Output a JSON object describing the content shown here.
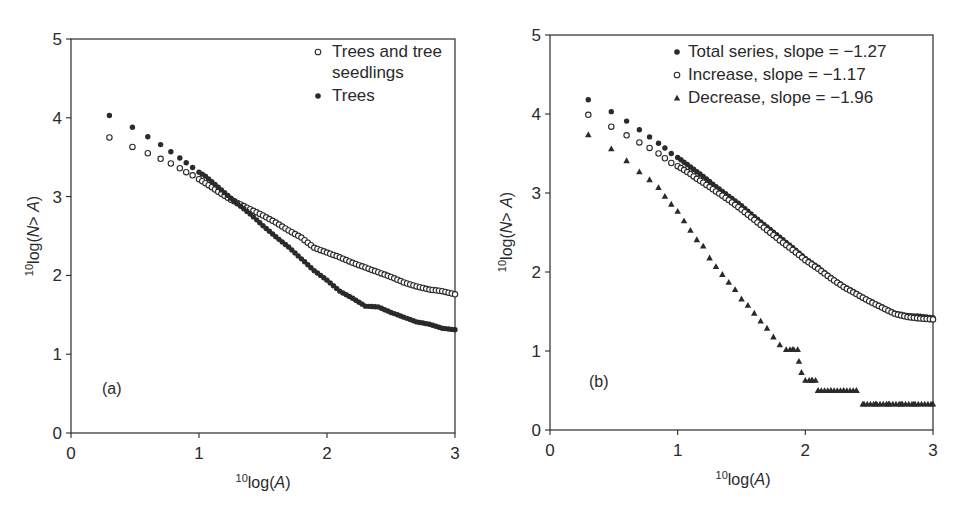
{
  "figure": {
    "panels": [
      {
        "id": "a",
        "panel_label": "(a)",
        "xlabel_sup": "10",
        "xlabel_main": "log(",
        "xlabel_var": "A",
        "xlabel_close": ")",
        "ylabel_sup": "10",
        "ylabel_main": "log(",
        "ylabel_var": "N",
        "ylabel_rest": "> ",
        "ylabel_var2": "A",
        "ylabel_close": ")",
        "xticks": [
          "0",
          "1",
          "2",
          "3"
        ],
        "yticks": [
          "0",
          "1",
          "2",
          "3",
          "4",
          "5"
        ],
        "legend": [
          {
            "marker": "open-circle",
            "label_lines": [
              "Trees and tree",
              "seedlings"
            ]
          },
          {
            "marker": "filled-circle",
            "label_lines": [
              "Trees"
            ]
          }
        ]
      },
      {
        "id": "b",
        "panel_label": "(b)",
        "xlabel_sup": "10",
        "xlabel_main": "log(",
        "xlabel_var": "A",
        "xlabel_close": ")",
        "ylabel_sup": "10",
        "ylabel_main": "log(",
        "ylabel_var": "N",
        "ylabel_rest": "> ",
        "ylabel_var2": "A",
        "ylabel_close": ")",
        "xticks": [
          "0",
          "1",
          "2",
          "3"
        ],
        "yticks": [
          "0",
          "1",
          "2",
          "3",
          "4",
          "5"
        ],
        "legend": [
          {
            "marker": "filled-circle",
            "label_lines": [
              "Total series, slope = −1.27"
            ]
          },
          {
            "marker": "open-circle",
            "label_lines": [
              "Increase, slope = −1.17"
            ]
          },
          {
            "marker": "filled-triangle",
            "label_lines": [
              "Decrease, slope = −1.96"
            ]
          }
        ]
      }
    ],
    "colors": {
      "ink": "#2a2a2a",
      "background": "#ffffff"
    }
  },
  "chart_data": [
    {
      "type": "scatter",
      "title": "(a)",
      "xlabel": "10log(A)",
      "ylabel": "10log(N > A)",
      "xlim": [
        0,
        3
      ],
      "ylim": [
        0,
        5
      ],
      "xticks": [
        0,
        1,
        2,
        3
      ],
      "yticks": [
        0,
        1,
        2,
        3,
        4,
        5
      ],
      "grid": false,
      "legend_position": "upper right",
      "series": [
        {
          "name": "Trees and tree seedlings",
          "marker": "open-circle",
          "x": [
            0.3,
            0.48,
            0.6,
            0.7,
            0.78,
            0.85,
            0.9,
            0.95,
            1.0,
            1.05,
            1.1,
            1.15,
            1.2,
            1.25,
            1.3,
            1.4,
            1.5,
            1.6,
            1.7,
            1.8,
            1.9,
            2.0,
            2.1,
            2.2,
            2.3,
            2.4,
            2.5,
            2.6,
            2.7,
            2.8,
            2.9,
            3.0
          ],
          "y": [
            3.75,
            3.63,
            3.55,
            3.48,
            3.42,
            3.36,
            3.31,
            3.27,
            3.22,
            3.17,
            3.12,
            3.06,
            3.01,
            2.96,
            2.92,
            2.84,
            2.76,
            2.67,
            2.57,
            2.48,
            2.35,
            2.29,
            2.23,
            2.16,
            2.1,
            2.04,
            1.98,
            1.91,
            1.86,
            1.82,
            1.8,
            1.76
          ]
        },
        {
          "name": "Trees",
          "marker": "filled-circle",
          "x": [
            0.3,
            0.48,
            0.6,
            0.7,
            0.78,
            0.85,
            0.9,
            0.95,
            1.0,
            1.05,
            1.1,
            1.15,
            1.2,
            1.25,
            1.3,
            1.4,
            1.5,
            1.6,
            1.7,
            1.8,
            1.9,
            2.0,
            2.1,
            2.2,
            2.3,
            2.4,
            2.5,
            2.6,
            2.7,
            2.8,
            2.9,
            3.0
          ],
          "y": [
            4.03,
            3.88,
            3.76,
            3.66,
            3.57,
            3.49,
            3.43,
            3.37,
            3.31,
            3.26,
            3.19,
            3.12,
            3.05,
            2.98,
            2.91,
            2.78,
            2.63,
            2.49,
            2.36,
            2.21,
            2.06,
            1.94,
            1.8,
            1.71,
            1.61,
            1.6,
            1.53,
            1.47,
            1.41,
            1.38,
            1.33,
            1.31
          ]
        }
      ],
      "annotations": [
        "(a)"
      ]
    },
    {
      "type": "scatter",
      "title": "(b)",
      "xlabel": "10log(A)",
      "ylabel": "10log(N > A)",
      "xlim": [
        0,
        3
      ],
      "ylim": [
        0,
        5
      ],
      "xticks": [
        0,
        1,
        2,
        3
      ],
      "yticks": [
        0,
        1,
        2,
        3,
        4,
        5
      ],
      "grid": false,
      "legend_position": "upper right",
      "series": [
        {
          "name": "Total series, slope = −1.27",
          "marker": "filled-circle",
          "x": [
            0.3,
            0.48,
            0.6,
            0.7,
            0.78,
            0.85,
            0.9,
            0.95,
            1.0,
            1.05,
            1.1,
            1.15,
            1.2,
            1.3,
            1.4,
            1.5,
            1.6,
            1.7,
            1.8,
            1.9,
            2.0,
            2.1,
            2.2,
            2.3,
            2.4,
            2.5,
            2.6,
            2.7,
            2.8,
            2.9,
            3.0
          ],
          "y": [
            4.18,
            4.03,
            3.91,
            3.8,
            3.71,
            3.63,
            3.57,
            3.5,
            3.45,
            3.39,
            3.33,
            3.27,
            3.21,
            3.08,
            2.96,
            2.84,
            2.7,
            2.57,
            2.44,
            2.31,
            2.17,
            2.06,
            1.93,
            1.82,
            1.73,
            1.64,
            1.56,
            1.48,
            1.45,
            1.44,
            1.42
          ]
        },
        {
          "name": "Increase, slope = −1.17",
          "marker": "open-circle",
          "x": [
            0.3,
            0.48,
            0.6,
            0.7,
            0.78,
            0.85,
            0.9,
            0.95,
            1.0,
            1.05,
            1.1,
            1.15,
            1.2,
            1.3,
            1.4,
            1.5,
            1.6,
            1.7,
            1.8,
            1.9,
            2.0,
            2.1,
            2.2,
            2.3,
            2.4,
            2.5,
            2.6,
            2.7,
            2.8,
            2.9,
            3.0
          ],
          "y": [
            3.99,
            3.84,
            3.73,
            3.64,
            3.57,
            3.5,
            3.44,
            3.38,
            3.34,
            3.29,
            3.24,
            3.18,
            3.13,
            3.02,
            2.91,
            2.79,
            2.66,
            2.53,
            2.4,
            2.28,
            2.15,
            2.04,
            1.92,
            1.81,
            1.72,
            1.63,
            1.55,
            1.47,
            1.43,
            1.41,
            1.4
          ]
        },
        {
          "name": "Decrease, slope = −1.96",
          "marker": "filled-triangle",
          "x": [
            0.3,
            0.48,
            0.6,
            0.7,
            0.78,
            0.85,
            0.9,
            0.95,
            1.0,
            1.05,
            1.1,
            1.15,
            1.2,
            1.25,
            1.3,
            1.35,
            1.4,
            1.45,
            1.5,
            1.55,
            1.6,
            1.65,
            1.7,
            1.75,
            1.8,
            1.85,
            1.9,
            1.95,
            1.97,
            2.0,
            2.05,
            2.1,
            2.2,
            2.3,
            2.4,
            2.45,
            2.55,
            2.65,
            2.75,
            2.85,
            3.0
          ],
          "y": [
            3.74,
            3.56,
            3.41,
            3.27,
            3.17,
            3.07,
            2.96,
            2.86,
            2.77,
            2.65,
            2.53,
            2.41,
            2.33,
            2.18,
            2.07,
            1.97,
            1.87,
            1.78,
            1.66,
            1.58,
            1.48,
            1.38,
            1.29,
            1.18,
            1.08,
            1.02,
            1.02,
            0.87,
            0.73,
            0.63,
            0.63,
            0.5,
            0.5,
            0.5,
            0.5,
            0.33,
            0.33,
            0.33,
            0.33,
            0.33,
            0.33
          ]
        }
      ],
      "annotations": [
        "(b)"
      ]
    }
  ]
}
